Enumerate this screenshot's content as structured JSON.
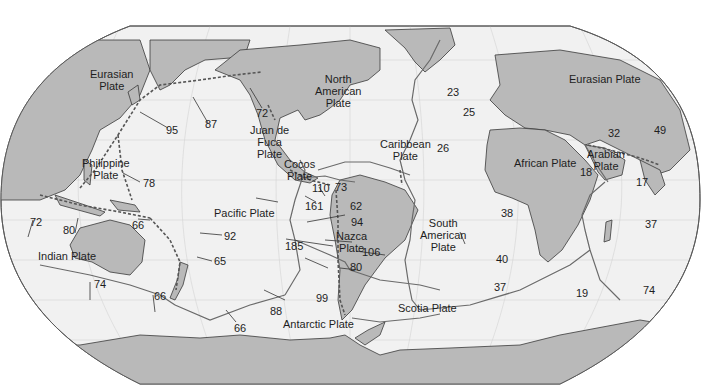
{
  "map": {
    "title": "Tectonic plates and relative plate motion rates",
    "colors": {
      "ocean": "#f1f1f1",
      "land": "#b9b9b9",
      "boundary": "#6a6a6a",
      "outline": "#5a5a5a",
      "text": "#1e1e1e",
      "background": "#ffffff"
    },
    "plates": [
      {
        "name": "Eurasian Plate (west)",
        "label": "Eurasian\nPlate"
      },
      {
        "name": "Eurasian Plate (east)",
        "label": "Eurasian Plate"
      },
      {
        "name": "North American Plate",
        "label": "North\nAmerican\nPlate"
      },
      {
        "name": "Juan de Fuca Plate",
        "label": "Juan de\nFuca\nPlate"
      },
      {
        "name": "Philippine Plate",
        "label": "Philippine\nPlate"
      },
      {
        "name": "Caribbean Plate",
        "label": "Caribbean\nPlate"
      },
      {
        "name": "Cocos Plate",
        "label": "Cocos\nPlate"
      },
      {
        "name": "Pacific Plate",
        "label": "Pacific Plate"
      },
      {
        "name": "Nazca Plate",
        "label": "Nazca\nPlate"
      },
      {
        "name": "South American Plate",
        "label": "South\nAmerican\nPlate"
      },
      {
        "name": "African Plate",
        "label": "African Plate"
      },
      {
        "name": "Arabian Plate",
        "label": "Arabian\nPlate"
      },
      {
        "name": "Indian Plate",
        "label": "Indian Plate"
      },
      {
        "name": "Scotia Plate",
        "label": "Scotia Plate"
      },
      {
        "name": "Antarctic Plate",
        "label": "Antarctic Plate"
      }
    ],
    "rates": [
      "95",
      "87",
      "72",
      "78",
      "72",
      "80",
      "66",
      "92",
      "65",
      "74",
      "66",
      "66",
      "88",
      "99",
      "110",
      "73",
      "161",
      "62",
      "94",
      "185",
      "106",
      "80",
      "23",
      "25",
      "26",
      "38",
      "40",
      "37",
      "19",
      "32",
      "49",
      "18",
      "17",
      "37",
      "74"
    ]
  }
}
